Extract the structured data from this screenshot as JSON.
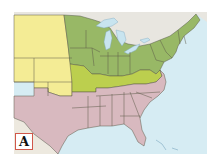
{
  "map": {
    "label": "A",
    "colors": {
      "background": "#ffffff",
      "ocean": "#d6ecf3",
      "canada": "#e8e6e0",
      "west_yellow": "#f4ec95",
      "north_green": "#98b866",
      "border_green": "#bccf4e",
      "south_pink": "#d8b9bf",
      "mexico": "#ede9df",
      "lakes": "#c8e4ef",
      "state_border": "#5c5a48",
      "label_border": "#d0574a"
    },
    "regions": [
      {
        "name": "Western territories",
        "color": "west_yellow"
      },
      {
        "name": "Northern states",
        "color": "north_green"
      },
      {
        "name": "Border states",
        "color": "border_green"
      },
      {
        "name": "Southern states",
        "color": "south_pink"
      }
    ]
  }
}
